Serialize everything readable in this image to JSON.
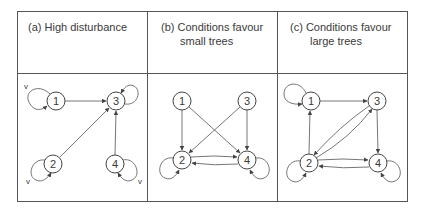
{
  "panels": [
    {
      "id": "a",
      "title_lines": [
        "(a) High disturbance"
      ],
      "nodes": [
        {
          "id": "1",
          "label": "1",
          "x": 56,
          "y": 101,
          "self_loop": "left",
          "v_mark": true
        },
        {
          "id": "2",
          "label": "2",
          "x": 53,
          "y": 164,
          "self_loop": "left-down",
          "v_mark": true
        },
        {
          "id": "3",
          "label": "3",
          "x": 116,
          "y": 101,
          "self_loop": "right-up",
          "v_mark": false
        },
        {
          "id": "4",
          "label": "4",
          "x": 115,
          "y": 164,
          "self_loop": "right-down",
          "v_mark": true
        }
      ],
      "edges": [
        {
          "from": "1",
          "to": "3"
        },
        {
          "from": "2",
          "to": "3"
        },
        {
          "from": "4",
          "to": "3"
        }
      ]
    },
    {
      "id": "b",
      "title_lines": [
        "(b) Conditions favour",
        "small trees"
      ],
      "nodes": [
        {
          "id": "1",
          "label": "1",
          "x": 182,
          "y": 101,
          "self_loop": null
        },
        {
          "id": "2",
          "label": "2",
          "x": 182,
          "y": 160,
          "self_loop": "left-down"
        },
        {
          "id": "3",
          "label": "3",
          "x": 247,
          "y": 101,
          "self_loop": null
        },
        {
          "id": "4",
          "label": "4",
          "x": 247,
          "y": 160,
          "self_loop": "right-down"
        }
      ],
      "edges": [
        {
          "from": "1",
          "to": "2"
        },
        {
          "from": "1",
          "to": "4"
        },
        {
          "from": "3",
          "to": "2"
        },
        {
          "from": "3",
          "to": "4"
        },
        {
          "from": "2",
          "to": "4"
        },
        {
          "from": "4",
          "to": "2"
        }
      ]
    },
    {
      "id": "c",
      "title_lines": [
        "(c) Conditions favour",
        "large trees"
      ],
      "nodes": [
        {
          "id": "1",
          "label": "1",
          "x": 311,
          "y": 101,
          "self_loop": "left-up"
        },
        {
          "id": "2",
          "label": "2",
          "x": 309,
          "y": 163,
          "self_loop": "left-down"
        },
        {
          "id": "3",
          "label": "3",
          "x": 377,
          "y": 101,
          "self_loop": null
        },
        {
          "id": "4",
          "label": "4",
          "x": 378,
          "y": 163,
          "self_loop": "right-down"
        }
      ],
      "edges": [
        {
          "from": "1",
          "to": "3"
        },
        {
          "from": "2",
          "to": "1"
        },
        {
          "from": "2",
          "to": "3"
        },
        {
          "from": "3",
          "to": "2"
        },
        {
          "from": "3",
          "to": "4"
        },
        {
          "from": "2",
          "to": "4"
        },
        {
          "from": "4",
          "to": "2"
        }
      ]
    }
  ],
  "v_label": "v",
  "colors": {
    "stroke": "#555555",
    "text": "#3a3a3a",
    "background": "#ffffff"
  }
}
